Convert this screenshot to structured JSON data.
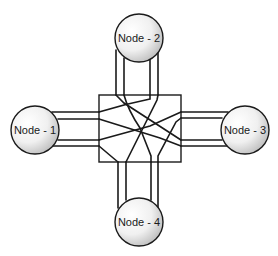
{
  "diagram": {
    "type": "network-interconnect",
    "center": {
      "label": "",
      "shape": "box",
      "x": 99,
      "y": 95,
      "width": 82,
      "height": 67
    },
    "nodes": [
      {
        "id": "node-1",
        "label": "Node - 1",
        "cx": 35,
        "cy": 130,
        "r": 24,
        "side": "left"
      },
      {
        "id": "node-2",
        "label": "Node - 2",
        "cx": 139,
        "cy": 38,
        "r": 24,
        "side": "top"
      },
      {
        "id": "node-3",
        "label": "Node - 3",
        "cx": 245,
        "cy": 130,
        "r": 24,
        "side": "right"
      },
      {
        "id": "node-4",
        "label": "Node - 4",
        "cx": 139,
        "cy": 222,
        "r": 24,
        "side": "bottom"
      }
    ],
    "links_per_node": 4,
    "colors": {
      "stroke": "#1a1a1a",
      "node_fill_light": "#ffffff",
      "node_fill_dark": "#b8b8b8",
      "background": "#ffffff"
    }
  }
}
